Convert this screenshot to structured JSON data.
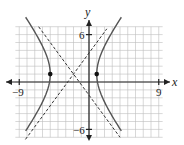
{
  "chart_data": {
    "type": "line",
    "title": "",
    "xlabel": "x",
    "ylabel": "y",
    "xlim": [
      -9,
      9
    ],
    "ylim": [
      -6,
      6
    ],
    "grid": true,
    "tick_labels": {
      "x": [
        "-9",
        "9"
      ],
      "y": [
        "6",
        "-6"
      ]
    },
    "hyperbola": {
      "equation": "(x+2)^2/9 - (y-1)^2/16 = 1",
      "center": [
        -2,
        1
      ],
      "a": 3,
      "b": 4,
      "vertices": [
        [
          -5,
          1
        ],
        [
          1,
          1
        ]
      ],
      "asymptotes": [
        "y - 1 = (4/3)(x + 2)",
        "y - 1 = -(4/3)(x + 2)"
      ]
    },
    "series": [
      {
        "name": "hyperbola",
        "style": "solid"
      },
      {
        "name": "asymptotes",
        "style": "dashed"
      },
      {
        "name": "vertices",
        "style": "points",
        "points": [
          [
            -5,
            1
          ],
          [
            1,
            1
          ]
        ]
      }
    ]
  },
  "labels": {
    "x_axis": "x",
    "y_axis": "y",
    "x_min": "−9",
    "x_max": "9",
    "y_max": "6",
    "y_min": "−6"
  }
}
